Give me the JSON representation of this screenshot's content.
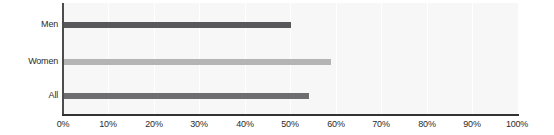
{
  "chart_data": {
    "type": "bar",
    "orientation": "horizontal",
    "title": "",
    "subtitle": "",
    "xlabel": "",
    "ylabel": "",
    "categories": [
      "Men",
      "Women",
      "All"
    ],
    "values": [
      50,
      59,
      54
    ],
    "value_suffix": "%",
    "xlim": [
      0,
      100
    ],
    "xticks": [
      0,
      10,
      20,
      30,
      40,
      50,
      60,
      70,
      80,
      90,
      100
    ],
    "xtick_labels": [
      "0%",
      "10%",
      "20%",
      "30%",
      "40%",
      "50%",
      "60%",
      "70%",
      "80%",
      "90%",
      "100%"
    ],
    "grid": true,
    "grid_axis": "x",
    "legend": false,
    "legend_position": "none",
    "bar_colors": [
      "#58585a",
      "#b4b4b4",
      "#6e6e70"
    ],
    "series": [
      {
        "name": "Men",
        "value": 50,
        "color": "#58585a"
      },
      {
        "name": "Women",
        "value": 59,
        "color": "#b4b4b4"
      },
      {
        "name": "All",
        "value": 54,
        "color": "#6e6e70"
      }
    ]
  },
  "style": {
    "plot_background": "#f7f7f7",
    "page_background": "#ffffff",
    "gridline_color": "#ffffff",
    "axis_color": "#333333",
    "tick_label_color": "#2b2b2b"
  }
}
